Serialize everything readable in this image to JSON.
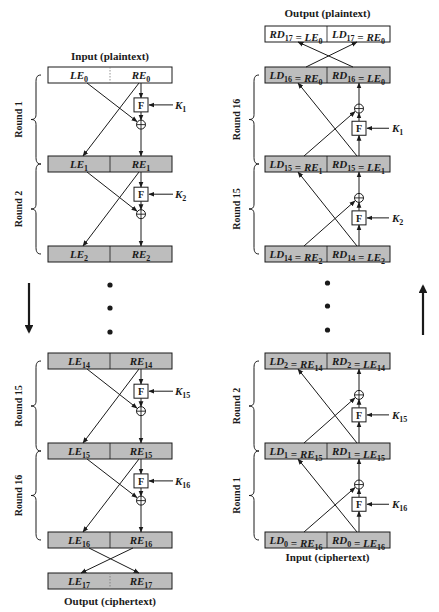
{
  "encryption": {
    "input_label": "Input (plaintext)",
    "output_label": "Output (ciphertext)",
    "direction": "down",
    "registers": [
      {
        "left": {
          "base": "LE",
          "sub": "0"
        },
        "right": {
          "base": "RE",
          "sub": "0"
        },
        "shaded": false
      },
      {
        "left": {
          "base": "LE",
          "sub": "1"
        },
        "right": {
          "base": "RE",
          "sub": "1"
        },
        "shaded": true
      },
      {
        "left": {
          "base": "LE",
          "sub": "2"
        },
        "right": {
          "base": "RE",
          "sub": "2"
        },
        "shaded": true
      },
      {
        "left": {
          "base": "LE",
          "sub": "14"
        },
        "right": {
          "base": "RE",
          "sub": "14"
        },
        "shaded": true
      },
      {
        "left": {
          "base": "LE",
          "sub": "15"
        },
        "right": {
          "base": "RE",
          "sub": "15"
        },
        "shaded": true
      },
      {
        "left": {
          "base": "LE",
          "sub": "16"
        },
        "right": {
          "base": "RE",
          "sub": "16"
        },
        "shaded": true
      },
      {
        "left": {
          "base": "LE",
          "sub": "17"
        },
        "right": {
          "base": "RE",
          "sub": "17"
        },
        "shaded": true
      }
    ],
    "rounds": [
      {
        "label": "Round 1",
        "key": {
          "base": "K",
          "sub": "1"
        },
        "function": "F"
      },
      {
        "label": "Round 2",
        "key": {
          "base": "K",
          "sub": "2"
        },
        "function": "F"
      },
      {
        "label": "Round 15",
        "key": {
          "base": "K",
          "sub": "15"
        },
        "function": "F"
      },
      {
        "label": "Round 16",
        "key": {
          "base": "K",
          "sub": "16"
        },
        "function": "F"
      }
    ]
  },
  "decryption": {
    "input_label": "Input (ciphertext)",
    "output_label": "Output (plaintext)",
    "direction": "up",
    "registers": [
      {
        "left": "RD17 = LE0",
        "right": "LD17 = RE0",
        "left_parts": [
          {
            "base": "RD",
            "sub": "17"
          },
          {
            "base": " = LE",
            "sub": "0"
          }
        ],
        "right_parts": [
          {
            "base": "LD",
            "sub": "17"
          },
          {
            "base": " = RE",
            "sub": "0"
          }
        ],
        "shaded": false
      },
      {
        "left": "LD16 = RE0",
        "right": "RD16 = LE0",
        "left_parts": [
          {
            "base": "LD",
            "sub": "16"
          },
          {
            "base": " = RE",
            "sub": "0"
          }
        ],
        "right_parts": [
          {
            "base": "RD",
            "sub": "16"
          },
          {
            "base": " = LE",
            "sub": "0"
          }
        ],
        "shaded": true
      },
      {
        "left": "LD15 = RE1",
        "right": "RD15 = LE1",
        "left_parts": [
          {
            "base": "LD",
            "sub": "15"
          },
          {
            "base": " = RE",
            "sub": "1"
          }
        ],
        "right_parts": [
          {
            "base": "RD",
            "sub": "15"
          },
          {
            "base": " = LE",
            "sub": "1"
          }
        ],
        "shaded": true
      },
      {
        "left": "LD14 = RE2",
        "right": "RD14 = LE2",
        "left_parts": [
          {
            "base": "LD",
            "sub": "14"
          },
          {
            "base": " = RE",
            "sub": "2"
          }
        ],
        "right_parts": [
          {
            "base": "RD",
            "sub": "14"
          },
          {
            "base": " = LE",
            "sub": "2"
          }
        ],
        "shaded": true
      },
      {
        "left": "LD2 = RE14",
        "right": "RD2 = LE14",
        "left_parts": [
          {
            "base": "LD",
            "sub": "2"
          },
          {
            "base": " = RE",
            "sub": "14"
          }
        ],
        "right_parts": [
          {
            "base": "RD",
            "sub": "2"
          },
          {
            "base": " = LE",
            "sub": "14"
          }
        ],
        "shaded": true
      },
      {
        "left": "LD1 = RE15",
        "right": "RD1 = LE15",
        "left_parts": [
          {
            "base": "LD",
            "sub": "1"
          },
          {
            "base": " = RE",
            "sub": "15"
          }
        ],
        "right_parts": [
          {
            "base": "RD",
            "sub": "1"
          },
          {
            "base": " = LE",
            "sub": "15"
          }
        ],
        "shaded": true
      },
      {
        "left": "LD0 = RE16",
        "right": "RD0 = LE16",
        "left_parts": [
          {
            "base": "LD",
            "sub": "0"
          },
          {
            "base": " = RE",
            "sub": "16"
          }
        ],
        "right_parts": [
          {
            "base": "RD",
            "sub": "0"
          },
          {
            "base": " = LE",
            "sub": "16"
          }
        ],
        "shaded": true
      }
    ],
    "rounds": [
      {
        "label": "Round 16",
        "key": {
          "base": "K",
          "sub": "1"
        },
        "function": "F"
      },
      {
        "label": "Round 15",
        "key": {
          "base": "K",
          "sub": "2"
        },
        "function": "F"
      },
      {
        "label": "Round 2",
        "key": {
          "base": "K",
          "sub": "15"
        },
        "function": "F"
      },
      {
        "label": "Round 1",
        "key": {
          "base": "K",
          "sub": "16"
        },
        "function": "F"
      }
    ]
  },
  "colors": {
    "shaded_fill": "#bdbdbd",
    "plain_fill": "#ffffff",
    "stroke": "#1a1a1a"
  }
}
